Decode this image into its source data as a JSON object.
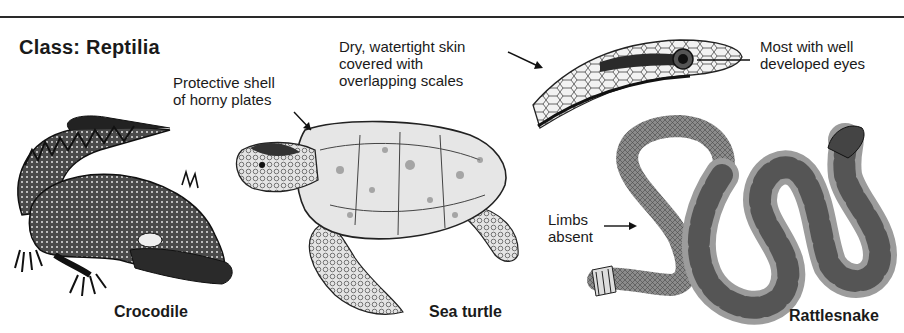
{
  "figure": {
    "title": "Class: Reptilia",
    "animals": [
      {
        "name": "crocodile",
        "caption": "Crocodile"
      },
      {
        "name": "sea-turtle",
        "caption": "Sea turtle"
      },
      {
        "name": "rattlesnake",
        "caption": "Rattlesnake"
      }
    ],
    "annotations": {
      "shell": "Protective shell\nof horny plates",
      "skin": "Dry, watertight skin\ncovered with\noverlapping scales",
      "eyes": "Most with well\ndeveloped eyes",
      "limbs": "Limbs\nabsent"
    },
    "colors": {
      "ink": "#1a1a1a",
      "background": "#ffffff",
      "mid_gray": "#7a7a7a",
      "light_gray": "#c8c8c8"
    }
  }
}
